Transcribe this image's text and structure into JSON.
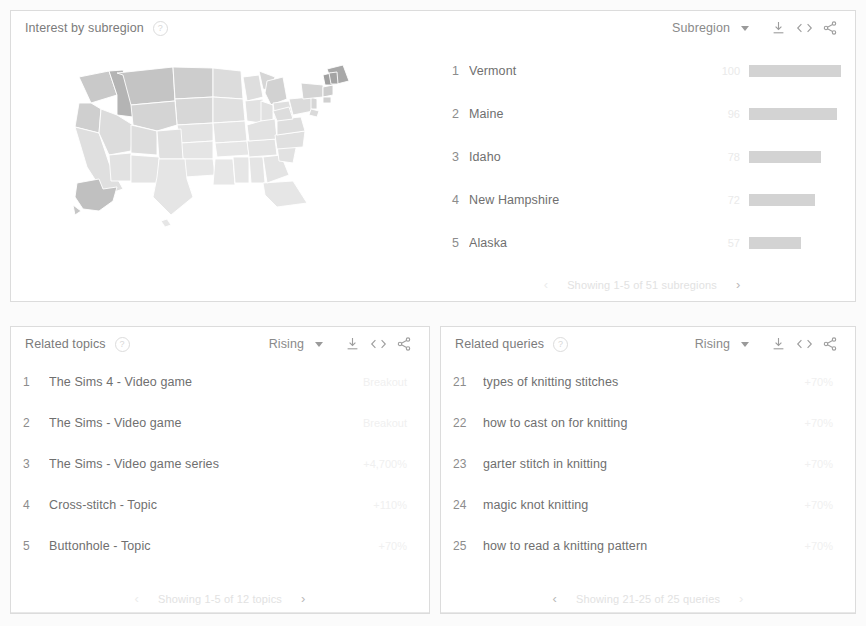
{
  "subregion_card": {
    "title": "Interest by subregion",
    "help_icon": "help-circle-icon",
    "selector_label": "Subregion",
    "tools": {
      "download": "download-icon",
      "embed": "embed-code-icon",
      "share": "share-icon"
    },
    "map": {
      "name": "united-states-choropleth-map",
      "regions_shown": 51
    },
    "columns": [
      "rank",
      "subregion",
      "value"
    ],
    "rows": [
      {
        "rank": "1",
        "name": "Vermont",
        "value": "100",
        "bar_pct": 100
      },
      {
        "rank": "2",
        "name": "Maine",
        "value": "96",
        "bar_pct": 96
      },
      {
        "rank": "3",
        "name": "Idaho",
        "value": "78",
        "bar_pct": 78
      },
      {
        "rank": "4",
        "name": "New Hampshire",
        "value": "72",
        "bar_pct": 72
      },
      {
        "rank": "5",
        "name": "Alaska",
        "value": "57",
        "bar_pct": 57
      }
    ],
    "pager": {
      "prev": "‹",
      "text": "Showing 1-5 of 51 subregions",
      "next": "›"
    }
  },
  "topics_card": {
    "title": "Related topics",
    "help_icon": "help-circle-icon",
    "selector_label": "Rising",
    "tools": {
      "download": "download-icon",
      "embed": "embed-code-icon",
      "share": "share-icon"
    },
    "rows": [
      {
        "rank": "1",
        "name": "The Sims 4 - Video game",
        "value": "Breakout"
      },
      {
        "rank": "2",
        "name": "The Sims - Video game",
        "value": "Breakout"
      },
      {
        "rank": "3",
        "name": "The Sims - Video game series",
        "value": "+4,700%"
      },
      {
        "rank": "4",
        "name": "Cross-stitch - Topic",
        "value": "+110%"
      },
      {
        "rank": "5",
        "name": "Buttonhole - Topic",
        "value": "+70%"
      }
    ],
    "pager": {
      "prev": "‹",
      "text": "Showing 1-5 of 12 topics",
      "next": "›"
    }
  },
  "queries_card": {
    "title": "Related queries",
    "help_icon": "help-circle-icon",
    "selector_label": "Rising",
    "tools": {
      "download": "download-icon",
      "embed": "embed-code-icon",
      "share": "share-icon"
    },
    "rows": [
      {
        "rank": "21",
        "name": "types of knitting stitches",
        "value": "+70%"
      },
      {
        "rank": "22",
        "name": "how to cast on for knitting",
        "value": "+70%"
      },
      {
        "rank": "23",
        "name": "garter stitch in knitting",
        "value": "+70%"
      },
      {
        "rank": "24",
        "name": "magic knot knitting",
        "value": "+70%"
      },
      {
        "rank": "25",
        "name": "how to read a knitting pattern",
        "value": "+70%"
      }
    ],
    "pager": {
      "prev": "‹",
      "text": "Showing 21-25 of 25 queries",
      "next": "›"
    }
  },
  "colors": {
    "card_border": "#dcdcdc",
    "text_primary": "#6f6f6f",
    "text_muted": "#8c8c8c",
    "bar": "#d3d3d3",
    "value_faded": "#eaeaea",
    "map_light": "#e9e9e9",
    "map_dark": "#b4b4b4"
  }
}
